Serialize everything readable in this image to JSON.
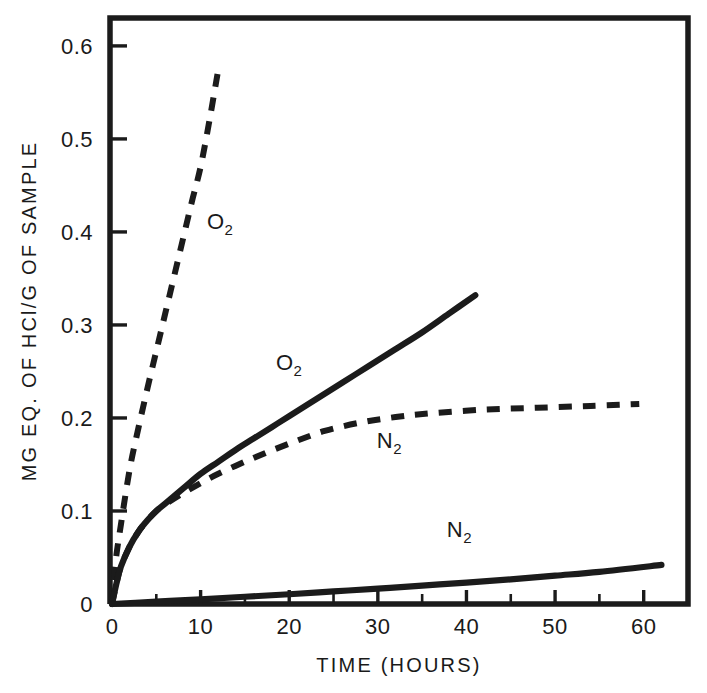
{
  "chart_data": {
    "type": "line",
    "title": "",
    "xlabel": "TIME (HOURS)",
    "ylabel": "MG EQ. OF HCl/G OF SAMPLE",
    "xlim": [
      0,
      65
    ],
    "ylim": [
      0,
      0.63
    ],
    "grid": false,
    "legend_position": "inline-annotations",
    "xticks": [
      0,
      10,
      20,
      30,
      40,
      50,
      60
    ],
    "xtick_labels": [
      "0",
      "10",
      "20",
      "30",
      "40",
      "50",
      "60"
    ],
    "xminor_ticks": [
      5,
      15,
      25,
      35,
      45,
      55
    ],
    "yticks": [
      0,
      0.1,
      0.2,
      0.3,
      0.4,
      0.5,
      0.6
    ],
    "ytick_labels": [
      "0",
      "0.1",
      "0.2",
      "0.3",
      "0.4",
      "0.5",
      "0.6"
    ],
    "series": [
      {
        "name": "O2-dashed",
        "label": "O",
        "label_sub": "2",
        "style": "dashed",
        "color": "#1b1b1b",
        "x": [
          0,
          0.4,
          1,
          2,
          3,
          4,
          5,
          6,
          7,
          8,
          9,
          10,
          11,
          12
        ],
        "values": [
          0.0,
          0.045,
          0.085,
          0.145,
          0.19,
          0.232,
          0.272,
          0.312,
          0.352,
          0.392,
          0.432,
          0.47,
          0.52,
          0.575
        ]
      },
      {
        "name": "O2-solid",
        "label": "O",
        "label_sub": "2",
        "style": "solid",
        "color": "#1b1b1b",
        "x": [
          0,
          0.5,
          1,
          2,
          3,
          4,
          5,
          6,
          8,
          10,
          12,
          14,
          16,
          18,
          20,
          23,
          26,
          29,
          32,
          35,
          38,
          41
        ],
        "values": [
          0.0,
          0.022,
          0.04,
          0.062,
          0.078,
          0.09,
          0.1,
          0.108,
          0.124,
          0.14,
          0.153,
          0.166,
          0.178,
          0.19,
          0.202,
          0.22,
          0.238,
          0.256,
          0.274,
          0.292,
          0.312,
          0.332
        ]
      },
      {
        "name": "N2-dashed",
        "label": "N",
        "label_sub": "2",
        "style": "dashed",
        "color": "#1b1b1b",
        "x": [
          0,
          0.5,
          1,
          2,
          3,
          4,
          5,
          6,
          8,
          10,
          12,
          15,
          18,
          21,
          24,
          28,
          32,
          36,
          42,
          48,
          54,
          59.5
        ],
        "values": [
          0.0,
          0.022,
          0.04,
          0.062,
          0.078,
          0.09,
          0.1,
          0.107,
          0.119,
          0.13,
          0.14,
          0.153,
          0.165,
          0.176,
          0.186,
          0.195,
          0.201,
          0.205,
          0.209,
          0.211,
          0.213,
          0.215
        ]
      },
      {
        "name": "N2-solid",
        "label": "N",
        "label_sub": "2",
        "style": "solid",
        "color": "#1b1b1b",
        "x": [
          0,
          5,
          10,
          15,
          20,
          25,
          30,
          35,
          40,
          45,
          50,
          55,
          62
        ],
        "values": [
          0.0,
          0.0025,
          0.005,
          0.0078,
          0.0105,
          0.0135,
          0.0165,
          0.0198,
          0.023,
          0.0265,
          0.0305,
          0.0345,
          0.042
        ]
      }
    ],
    "annotations": [
      {
        "name": "label-o2-dashed",
        "text": "O",
        "sub": "2",
        "x": 12.2,
        "y": 0.403
      },
      {
        "name": "label-o2-solid",
        "text": "O",
        "sub": "2",
        "x": 20.0,
        "y": 0.252
      },
      {
        "name": "label-n2-dashed",
        "text": "N",
        "sub": "2",
        "x": 31.3,
        "y": 0.168
      },
      {
        "name": "label-n2-solid",
        "text": "N",
        "sub": "2",
        "x": 39.2,
        "y": 0.072
      }
    ]
  }
}
